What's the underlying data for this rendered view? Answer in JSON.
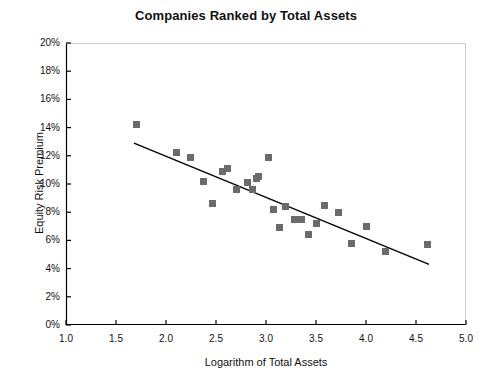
{
  "chart_data": {
    "type": "scatter",
    "title": "Companies Ranked by Total Assets",
    "xlabel": "Logarithm of Total Assets",
    "ylabel": "Equity Risk Premium",
    "xlim": [
      1.0,
      5.0
    ],
    "ylim": [
      0,
      20
    ],
    "grid": false,
    "legend": null,
    "xticks": [
      "1.0",
      "1.5",
      "2.0",
      "2.5",
      "3.0",
      "3.5",
      "4.0",
      "4.5",
      "5.0"
    ],
    "xtick_values": [
      1.0,
      1.5,
      2.0,
      2.5,
      3.0,
      3.5,
      4.0,
      4.5,
      5.0
    ],
    "yticks": [
      "0%",
      "2%",
      "4%",
      "6%",
      "8%",
      "10%",
      "12%",
      "14%",
      "16%",
      "18%",
      "20%"
    ],
    "ytick_values": [
      0,
      2,
      4,
      6,
      8,
      10,
      12,
      14,
      16,
      18,
      20
    ],
    "marker_color": "#6b6b6b",
    "marker_shape": "square",
    "line_color": "#000000",
    "axis_color": "#000000",
    "points": [
      {
        "x": 1.7,
        "y": 14.2
      },
      {
        "x": 2.1,
        "y": 12.2
      },
      {
        "x": 2.24,
        "y": 11.9
      },
      {
        "x": 2.37,
        "y": 10.2
      },
      {
        "x": 2.46,
        "y": 8.6
      },
      {
        "x": 2.56,
        "y": 10.9
      },
      {
        "x": 2.61,
        "y": 11.1
      },
      {
        "x": 2.7,
        "y": 9.6
      },
      {
        "x": 2.81,
        "y": 10.1
      },
      {
        "x": 2.86,
        "y": 9.6
      },
      {
        "x": 2.9,
        "y": 10.4
      },
      {
        "x": 2.92,
        "y": 10.5
      },
      {
        "x": 3.02,
        "y": 11.9
      },
      {
        "x": 3.07,
        "y": 8.2
      },
      {
        "x": 3.13,
        "y": 6.9
      },
      {
        "x": 3.19,
        "y": 8.4
      },
      {
        "x": 3.28,
        "y": 7.5
      },
      {
        "x": 3.35,
        "y": 7.5
      },
      {
        "x": 3.42,
        "y": 6.4
      },
      {
        "x": 3.5,
        "y": 7.2
      },
      {
        "x": 3.58,
        "y": 8.5
      },
      {
        "x": 3.72,
        "y": 8.0
      },
      {
        "x": 3.85,
        "y": 5.8
      },
      {
        "x": 4.0,
        "y": 7.0
      },
      {
        "x": 4.19,
        "y": 5.2
      },
      {
        "x": 4.61,
        "y": 5.7
      }
    ],
    "trendline": {
      "x1": 1.68,
      "y1": 12.9,
      "x2": 4.63,
      "y2": 4.3
    }
  }
}
